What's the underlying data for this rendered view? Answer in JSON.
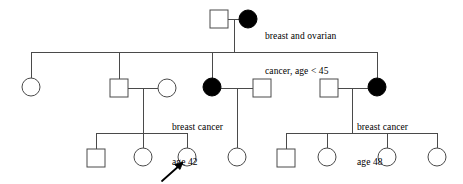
{
  "figure": {
    "kind": "pedigree-chart",
    "width": 463,
    "height": 184,
    "background_color": "#ffffff",
    "line_color": "#4a4a4a",
    "affected_fill_color": "#000000",
    "unaffected_fill_color": "#ffffff",
    "symbol_size": 18
  },
  "annotations": {
    "proband_marker": "arrow",
    "top_mother": {
      "line1": "breast and ovarian",
      "line2": "cancer, age < 45"
    },
    "gen2_daughter": {
      "line1": "breast cancer",
      "line2": "age 42"
    },
    "gen2_daughter_right": {
      "line1": "breast cancer",
      "line2": "age 48"
    }
  },
  "individuals": [
    {
      "id": "I-1",
      "generation": 1,
      "sex": "male",
      "shape": "square",
      "affected": false,
      "cx": 219,
      "cy": 19,
      "label": ""
    },
    {
      "id": "I-2",
      "generation": 1,
      "sex": "female",
      "shape": "circle",
      "affected": true,
      "cx": 248,
      "cy": 19,
      "label": "breast and ovarian cancer, age < 45"
    },
    {
      "id": "II-1",
      "generation": 2,
      "sex": "female",
      "shape": "circle",
      "affected": false,
      "cx": 31,
      "cy": 87,
      "label": ""
    },
    {
      "id": "II-2",
      "generation": 2,
      "sex": "male",
      "shape": "square",
      "affected": false,
      "cx": 119,
      "cy": 88,
      "label": ""
    },
    {
      "id": "II-3",
      "generation": 2,
      "sex": "female",
      "shape": "circle",
      "affected": false,
      "cx": 167,
      "cy": 88,
      "label": ""
    },
    {
      "id": "II-4",
      "generation": 2,
      "sex": "female",
      "shape": "circle",
      "affected": true,
      "cx": 212,
      "cy": 87,
      "label": "breast cancer age 42"
    },
    {
      "id": "II-5",
      "generation": 2,
      "sex": "male",
      "shape": "square",
      "affected": false,
      "cx": 262,
      "cy": 88,
      "label": ""
    },
    {
      "id": "II-6",
      "generation": 2,
      "sex": "male",
      "shape": "square",
      "affected": false,
      "cx": 329,
      "cy": 88,
      "label": ""
    },
    {
      "id": "II-7",
      "generation": 2,
      "sex": "female",
      "shape": "circle",
      "affected": true,
      "cx": 377,
      "cy": 87,
      "label": "breast cancer age 48"
    },
    {
      "id": "III-1",
      "generation": 3,
      "sex": "male",
      "shape": "square",
      "affected": false,
      "cx": 96,
      "cy": 157,
      "label": ""
    },
    {
      "id": "III-2",
      "generation": 3,
      "sex": "female",
      "shape": "circle",
      "affected": false,
      "cx": 143,
      "cy": 157,
      "label": ""
    },
    {
      "id": "III-3",
      "generation": 3,
      "sex": "female",
      "shape": "circle",
      "affected": false,
      "cx": 187,
      "cy": 157,
      "label": "",
      "proband": true
    },
    {
      "id": "III-4",
      "generation": 3,
      "sex": "female",
      "shape": "circle",
      "affected": false,
      "cx": 237,
      "cy": 157,
      "label": ""
    },
    {
      "id": "III-5",
      "generation": 3,
      "sex": "male",
      "shape": "square",
      "affected": false,
      "cx": 286,
      "cy": 157,
      "label": ""
    },
    {
      "id": "III-6",
      "generation": 3,
      "sex": "female",
      "shape": "circle",
      "affected": false,
      "cx": 327,
      "cy": 157,
      "label": ""
    },
    {
      "id": "III-7",
      "generation": 3,
      "sex": "female",
      "shape": "circle",
      "affected": false,
      "cx": 387,
      "cy": 157,
      "label": ""
    },
    {
      "id": "III-8",
      "generation": 3,
      "sex": "female",
      "shape": "circle",
      "affected": false,
      "cx": 437,
      "cy": 157,
      "label": ""
    }
  ],
  "text_positions": {
    "top_mother": {
      "x": 265,
      "y": 8
    },
    "gen2_daughter": {
      "x": 172,
      "y": 99
    },
    "gen2_daughter_right": {
      "x": 357,
      "y": 99
    }
  }
}
